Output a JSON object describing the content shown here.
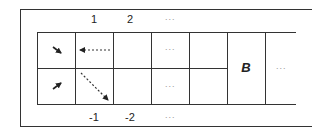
{
  "diagram": {
    "top_labels": [
      "1",
      "2",
      "···"
    ],
    "bottom_labels": [
      "-1",
      "-2",
      "···"
    ],
    "cells": {
      "row1_col3_ellipsis": "···",
      "row2_col3_ellipsis": "···",
      "merged_cell_label": "B",
      "last_col_ellipsis": "···"
    },
    "arrows": [
      {
        "cell": "row1-col0",
        "type": "solid-short",
        "direction": "down-right"
      },
      {
        "cell": "row1-col1",
        "type": "dashed",
        "direction": "left"
      },
      {
        "cell": "row2-col0",
        "type": "solid-short",
        "direction": "up-right"
      },
      {
        "cell": "row2-col1",
        "type": "dashed",
        "direction": "down-right"
      }
    ],
    "colors": {
      "line": "#333333",
      "ellipsis": "#999999",
      "background": "#ffffff"
    }
  }
}
